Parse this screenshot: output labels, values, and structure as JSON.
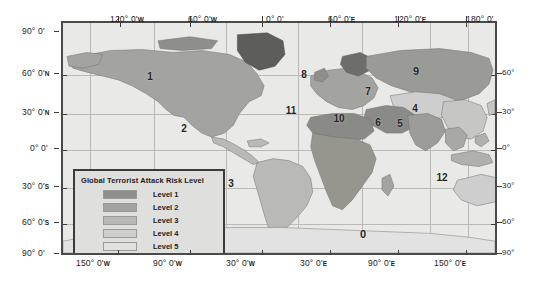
{
  "map": {
    "title": "Global Terrorist Attack Risk Level map",
    "projection_note": "World map with graticule",
    "background_color": "#e9e9e7",
    "frame_color": "#4a4a4a"
  },
  "axes": {
    "top": [
      {
        "label": "120° 0'",
        "hemi": "W",
        "x": 152
      },
      {
        "label": "60° 0'",
        "hemi": "W",
        "x": 224
      },
      {
        "label": "0° 0'",
        "hemi": "",
        "x": 296
      },
      {
        "label": "60° 0'",
        "hemi": "E",
        "x": 360
      },
      {
        "label": "120° 0'",
        "hemi": "E",
        "x": 428
      },
      {
        "label": "180° 0'",
        "hemi": "",
        "x": 498
      }
    ],
    "bottom": [
      {
        "label": "150° 0'",
        "hemi": "W",
        "x": 118
      },
      {
        "label": "90° 0'",
        "hemi": "W",
        "x": 190
      },
      {
        "label": "30° 0'",
        "hemi": "W",
        "x": 262
      },
      {
        "label": "30° 0'",
        "hemi": "E",
        "x": 330
      },
      {
        "label": "90° 0'",
        "hemi": "E",
        "x": 398
      },
      {
        "label": "150° 0'",
        "hemi": "E",
        "x": 466
      }
    ],
    "left": [
      {
        "label": "90° 0'",
        "hemi": "",
        "y": 31
      },
      {
        "label": "60° 0'",
        "hemi": "N",
        "y": 73
      },
      {
        "label": "30° 0'",
        "hemi": "N",
        "y": 112
      },
      {
        "label": "0° 0'",
        "hemi": "",
        "y": 148
      },
      {
        "label": "30° 0'",
        "hemi": "S",
        "y": 186
      },
      {
        "label": "60° 0'",
        "hemi": "S",
        "y": 222
      },
      {
        "label": "90° 0'",
        "hemi": "",
        "y": 253
      }
    ],
    "right": [
      {
        "label": "60°",
        "y": 73
      },
      {
        "label": "30°",
        "y": 112
      },
      {
        "label": "0°",
        "y": 148
      },
      {
        "label": "30°",
        "y": 186
      },
      {
        "label": "60°",
        "y": 222
      },
      {
        "label": "90°",
        "y": 253
      }
    ]
  },
  "legend": {
    "title": "Global Terrorist Attack Risk Level",
    "items": [
      {
        "label": "Level 1",
        "color": "#8e8e8a"
      },
      {
        "label": "Level 2",
        "color": "#a3a3a0"
      },
      {
        "label": "Level 3",
        "color": "#b9b9b6"
      },
      {
        "label": "Level 4",
        "color": "#cecece"
      },
      {
        "label": "Level 5",
        "color": "#e2e2e2"
      }
    ]
  },
  "region_labels": [
    {
      "id": "1",
      "x": 148,
      "y": 74
    },
    {
      "id": "2",
      "x": 182,
      "y": 126
    },
    {
      "id": "3",
      "x": 229,
      "y": 181
    },
    {
      "id": "4",
      "x": 413,
      "y": 106
    },
    {
      "id": "5",
      "x": 398,
      "y": 121
    },
    {
      "id": "6",
      "x": 376,
      "y": 120
    },
    {
      "id": "7",
      "x": 366,
      "y": 89
    },
    {
      "id": "8",
      "x": 302,
      "y": 72
    },
    {
      "id": "9",
      "x": 414,
      "y": 69
    },
    {
      "id": "10",
      "x": 337,
      "y": 116
    },
    {
      "id": "11",
      "x": 289,
      "y": 108
    },
    {
      "id": "12",
      "x": 440,
      "y": 175
    },
    {
      "id": "0",
      "x": 361,
      "y": 232
    }
  ]
}
